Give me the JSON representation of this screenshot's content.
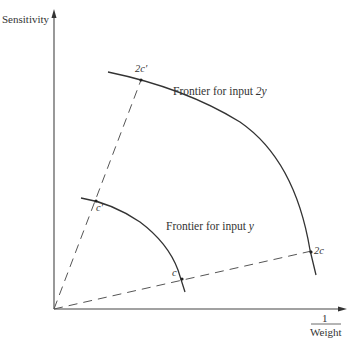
{
  "diagram": {
    "axes": {
      "y_label": "Sensitivity",
      "x_label_numerator": "1",
      "x_label_denominator": "Weight"
    },
    "frontiers": [
      {
        "name": "frontier-input-y",
        "label_prefix": "Frontier for input ",
        "label_var": "y"
      },
      {
        "name": "frontier-input-2y",
        "label_prefix": "Frontier for input ",
        "label_var": "2y"
      }
    ],
    "points": {
      "c_prime": "c′",
      "two_c_prime": "2c′",
      "c": "c",
      "two_c": "2c"
    },
    "rays": [
      "origin-to-c-prime-ray",
      "origin-to-c-ray"
    ],
    "colors": {
      "ink": "#333333",
      "axis": "#444444",
      "background": "#ffffff"
    }
  }
}
